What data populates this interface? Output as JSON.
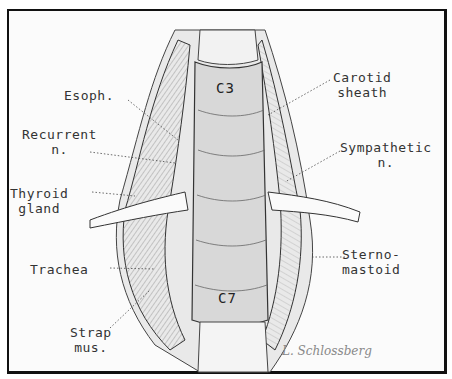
{
  "figure": {
    "type": "anatomical illustration",
    "vertebral_labels": {
      "top": "C3",
      "bottom": "C7"
    },
    "labels_left": [
      {
        "id": "esoph",
        "text": "Esoph."
      },
      {
        "id": "recurrent",
        "text": "Recurrent\nn."
      },
      {
        "id": "thyroid",
        "text": "Thyroid\ngland"
      },
      {
        "id": "trachea",
        "text": "Trachea"
      },
      {
        "id": "strap",
        "text": "Strap\nmus."
      }
    ],
    "labels_right": [
      {
        "id": "carotid",
        "text": "Carotid\nsheath"
      },
      {
        "id": "sympathetic",
        "text": "Sympathetic\nn."
      },
      {
        "id": "sterno",
        "text": "Sterno-\nmastoid"
      }
    ],
    "signature": "L. Schlossberg"
  }
}
